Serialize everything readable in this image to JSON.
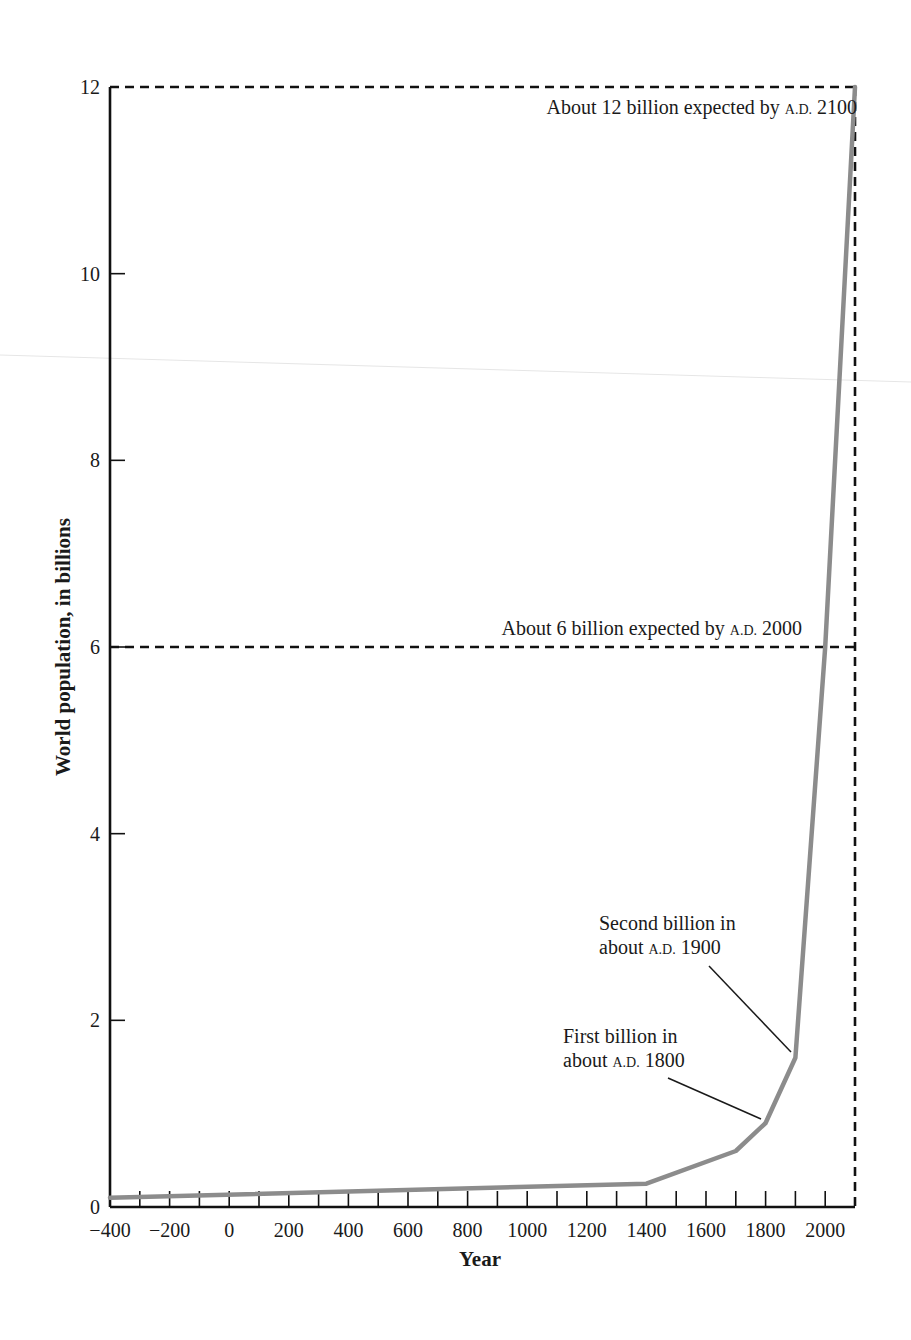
{
  "chart_data": {
    "type": "line",
    "title": "",
    "xlabel": "Year",
    "ylabel": "World population, in billions",
    "xlim": [
      -400,
      2100
    ],
    "ylim": [
      0,
      12
    ],
    "x_ticks_labeled": [
      -400,
      -200,
      0,
      200,
      400,
      600,
      800,
      1000,
      1200,
      1400,
      1600,
      1800,
      2000
    ],
    "x_tick_labels": [
      "−400",
      "−200",
      "0",
      "200",
      "400",
      "600",
      "800",
      "1000",
      "1200",
      "1400",
      "1600",
      "1800",
      "2000"
    ],
    "x_minor_tick_step": 100,
    "y_ticks": [
      0,
      2,
      4,
      6,
      8,
      10,
      12
    ],
    "y_tick_labels": [
      "0",
      "2",
      "4",
      "6",
      "8",
      "10",
      "12"
    ],
    "grid": false,
    "legend": null,
    "series": [
      {
        "name": "World population",
        "color": "#8c8c8c",
        "x": [
          -400,
          1400,
          1700,
          1800,
          1900,
          2000,
          2100
        ],
        "y": [
          0.1,
          0.25,
          0.6,
          0.9,
          1.6,
          6.0,
          12.0
        ]
      }
    ],
    "reference_lines": [
      {
        "type": "horizontal",
        "y": 12,
        "x_from": -400,
        "x_to": 2100,
        "style": "dashed",
        "color": "#111111"
      },
      {
        "type": "vertical",
        "x": 2100,
        "y_from": 0,
        "y_to": 12,
        "style": "dashed",
        "color": "#111111"
      },
      {
        "type": "horizontal",
        "y": 6,
        "x_from": -400,
        "x_to": 2100,
        "style": "dashed",
        "color": "#111111"
      }
    ],
    "annotations": [
      {
        "id": "twelve",
        "prefix": "About 12 billion expected by ",
        "era": "A.D.",
        "year": "2100",
        "x": 2100,
        "y": 12
      },
      {
        "id": "six",
        "prefix": "About 6 billion expected by ",
        "era": "A.D.",
        "year": "2000",
        "x": 2000,
        "y": 6
      },
      {
        "id": "second",
        "line1": "Second billion in",
        "line2_prefix": "about ",
        "era": "A.D.",
        "year": "1900",
        "x": 1900,
        "y": 1.6
      },
      {
        "id": "first",
        "line1": "First billion in",
        "line2_prefix": "about ",
        "era": "A.D.",
        "year": "1800",
        "x": 1800,
        "y": 0.9
      }
    ]
  }
}
